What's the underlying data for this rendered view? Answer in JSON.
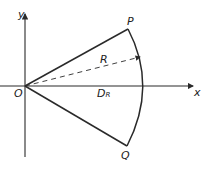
{
  "diagram": {
    "type": "sector-geometry",
    "colors": {
      "stroke": "#2a2a2a",
      "background": "#ffffff"
    },
    "axes": {
      "x_label": "x",
      "y_label": "y"
    },
    "points": {
      "origin": "O",
      "upper": "P",
      "lower": "Q"
    },
    "labels": {
      "radius": "R",
      "distance_main": "D",
      "distance_sub": "R"
    }
  }
}
